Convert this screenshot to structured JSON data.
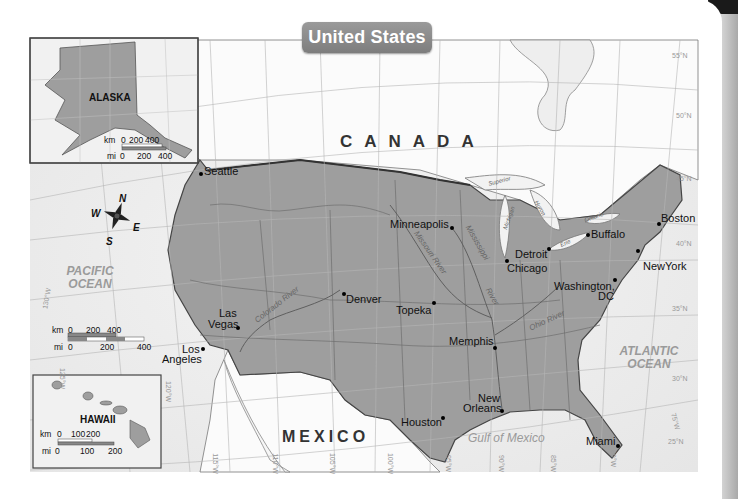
{
  "title": "United States",
  "countries": {
    "canada": "CANADA",
    "mexico": "MEXICO"
  },
  "water": {
    "pacific": "PACIFIC OCEAN",
    "atlantic": "ATLANTIC OCEAN",
    "gulf": "Gulf of Mexico"
  },
  "cities": [
    {
      "name": "Seattle",
      "x": 201,
      "y": 173
    },
    {
      "name": "Minneapolis",
      "x": 452,
      "y": 228
    },
    {
      "name": "Detroit",
      "x": 549,
      "y": 248
    },
    {
      "name": "Chicago",
      "x": 507,
      "y": 260
    },
    {
      "name": "Buffalo",
      "x": 588,
      "y": 235
    },
    {
      "name": "Boston",
      "x": 659,
      "y": 224
    },
    {
      "name": "NewYork",
      "x": 638,
      "y": 250
    },
    {
      "name": "Washington, DC",
      "x": 615,
      "y": 279
    },
    {
      "name": "Denver",
      "x": 344,
      "y": 293
    },
    {
      "name": "Topeka",
      "x": 434,
      "y": 302
    },
    {
      "name": "Las Vegas",
      "x": 238,
      "y": 327
    },
    {
      "name": "Los Angeles",
      "x": 203,
      "y": 348
    },
    {
      "name": "Memphis",
      "x": 495,
      "y": 347
    },
    {
      "name": "New Orleans",
      "x": 502,
      "y": 409
    },
    {
      "name": "Houston",
      "x": 442,
      "y": 418
    },
    {
      "name": "Miami",
      "x": 617,
      "y": 446
    }
  ],
  "city_labels": {
    "seattle": "Seattle",
    "minneapolis": "Minneapolis",
    "detroit": "Detroit",
    "chicago": "Chicago",
    "buffalo": "Buffalo",
    "boston": "Boston",
    "newyork": "NewYork",
    "washington_1": "Washington,",
    "washington_2": "DC",
    "denver": "Denver",
    "topeka": "Topeka",
    "lasvegas_1": "Las",
    "lasvegas_2": "Vegas",
    "losangeles_1": "Los",
    "losangeles_2": "Angeles",
    "memphis": "Memphis",
    "neworleans_1": "New",
    "neworleans_2": "Orleans",
    "houston": "Houston",
    "miami": "Miami"
  },
  "rivers": {
    "missouri": "Missouri River",
    "mississippi": "Mississippi",
    "mississippi_river": "River",
    "ohio": "Ohio River",
    "colorado": "Colorado River"
  },
  "lakes": {
    "superior": "Superior",
    "michigan": "Michigan",
    "huron": "Huron",
    "erie": "Erie",
    "ontario": "Ontario"
  },
  "compass": {
    "n": "N",
    "s": "S",
    "e": "E",
    "w": "W"
  },
  "insets": {
    "alaska": {
      "name": "ALASKA",
      "scale_km": [
        "km",
        "0",
        "200",
        "400"
      ],
      "scale_mi": [
        "mi",
        "0",
        "200",
        "400"
      ],
      "grid": [
        "170°W",
        "160°W",
        "150°W",
        "140°W",
        "130°W",
        "55°N"
      ]
    },
    "hawaii": {
      "name": "HAWAII",
      "scale_km": [
        "km",
        "0",
        "100",
        "200"
      ],
      "scale_mi": [
        "mi",
        "0",
        "100",
        "200"
      ],
      "grid": [
        "160°W",
        "22°N",
        "20°N",
        "155°W"
      ]
    }
  },
  "main_scale": {
    "km": [
      "km",
      "0",
      "200",
      "400"
    ],
    "mi": [
      "mi",
      "0",
      "200",
      "400"
    ]
  },
  "graticule": {
    "lat": [
      "55°N",
      "50°N",
      "45°N",
      "40°N",
      "35°N",
      "30°N",
      "25°N"
    ],
    "lon": [
      "130°W",
      "125°W",
      "120°W",
      "115°W",
      "110°W",
      "105°W",
      "100°W",
      "95°W",
      "90°W",
      "85°W",
      "80°W",
      "75°W"
    ]
  },
  "colors": {
    "land_us": "#9c9c9c",
    "land_other": "#ffffff",
    "water": "#eeeeee",
    "border": "#444444",
    "badge": "#8a8a8a"
  }
}
